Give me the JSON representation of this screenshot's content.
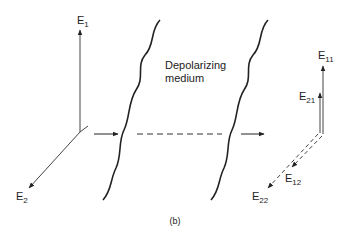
{
  "labels": {
    "e1": "E",
    "e1_sub": "1",
    "e2": "E",
    "e2_sub": "2",
    "medium_line1": "Depolarizing",
    "medium_line2": "medium",
    "e11": "E",
    "e11_sub": "11",
    "e21": "E",
    "e21_sub": "21",
    "e12": "E",
    "e12_sub": "12",
    "e22": "E",
    "e22_sub": "22",
    "caption": "(b)"
  },
  "colors": {
    "line": "#222222",
    "background": "#ffffff"
  }
}
